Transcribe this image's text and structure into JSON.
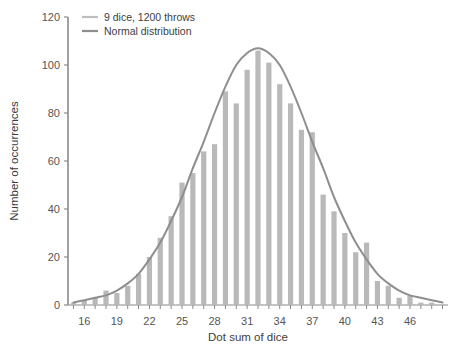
{
  "chart_data": {
    "type": "bar",
    "title": "",
    "xlabel": "Dot sum of dice",
    "ylabel": "Number of occurrences",
    "xlim": [
      14.5,
      49.5
    ],
    "ylim": [
      0,
      120
    ],
    "xticks": [
      16,
      19,
      22,
      25,
      28,
      31,
      34,
      37,
      40,
      43,
      46
    ],
    "yticks": [
      0,
      20,
      40,
      60,
      80,
      100,
      120
    ],
    "grid": false,
    "legend_position": "top-left",
    "legend": [
      {
        "label": "9 dice, 1200 throws",
        "color": "#bcbcbc",
        "kind": "bar"
      },
      {
        "label": "Normal distribution",
        "color": "#8e8e8e",
        "kind": "line"
      }
    ],
    "bar_color": "#b9b9b9",
    "line_color": "#8e8e8e",
    "series": [
      {
        "name": "9 dice, 1200 throws",
        "kind": "bar",
        "x": [
          15,
          16,
          17,
          18,
          19,
          20,
          21,
          22,
          23,
          24,
          25,
          26,
          27,
          28,
          29,
          30,
          31,
          32,
          33,
          34,
          35,
          36,
          37,
          38,
          39,
          40,
          41,
          42,
          43,
          44,
          45,
          46,
          47,
          48
        ],
        "values": [
          1,
          2,
          3,
          6,
          5,
          8,
          13,
          20,
          28,
          37,
          51,
          55,
          64,
          67,
          89,
          84,
          98,
          106,
          101,
          92,
          84,
          73,
          72,
          46,
          39,
          30,
          22,
          26,
          10,
          8,
          3,
          4,
          1,
          1
        ]
      },
      {
        "name": "Normal distribution",
        "kind": "line",
        "x": [
          15,
          16,
          17,
          18,
          19,
          20,
          21,
          22,
          23,
          24,
          25,
          26,
          27,
          28,
          29,
          30,
          31,
          32,
          33,
          34,
          35,
          36,
          37,
          38,
          39,
          40,
          41,
          42,
          43,
          44,
          45,
          46,
          47,
          48,
          49
        ],
        "values": [
          1,
          2,
          3,
          4,
          6,
          9,
          13,
          19,
          26,
          35,
          45,
          57,
          68,
          80,
          91,
          100,
          105,
          107,
          105,
          100,
          91,
          80,
          68,
          57,
          45,
          35,
          26,
          19,
          13,
          9,
          6,
          4,
          3,
          2,
          1
        ]
      }
    ]
  }
}
